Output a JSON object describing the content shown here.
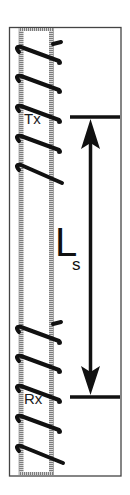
{
  "diagram": {
    "type": "borehole-sonde schematic",
    "transmitter": {
      "label": "Tx",
      "turns": 5
    },
    "receiver": {
      "label": "Rx",
      "turns": 5
    },
    "spacing": {
      "label_main": "L",
      "label_sub": "s",
      "description": "coil spacing between Tx and Rx"
    },
    "colors": {
      "line": "#111111",
      "hatch": "#8a8a8a",
      "frame": "#444444",
      "background": "#ffffff"
    }
  }
}
